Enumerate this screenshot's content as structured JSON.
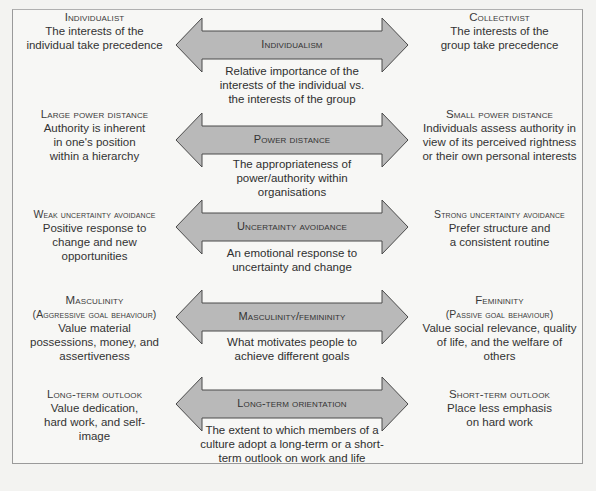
{
  "diagram": {
    "arrow_fill": "#b9b9b9",
    "arrow_stroke": "#4a4a4a",
    "dimensions": [
      {
        "name": "Individualism",
        "left_pole": {
          "title": "Individualist",
          "description": "The interests of the individual take precedence"
        },
        "right_pole": {
          "title": "Collectivist",
          "description": "The interests of the group take precedence"
        },
        "definition": "Relative importance of the interests of the individual vs. the interests of the group"
      },
      {
        "name": "Power distance",
        "left_pole": {
          "title": "Large power distance",
          "description": "Authority is inherent in one's position within a hierarchy"
        },
        "right_pole": {
          "title": "Small power distance",
          "description": "Individuals assess authority in view of its perceived rightness or their own personal interests"
        },
        "definition": "The appropriateness of power/authority within organisations"
      },
      {
        "name": "Uncertainty avoidance",
        "left_pole": {
          "title": "Weak uncertainty avoidance",
          "description": "Positive response to change and new opportunities"
        },
        "right_pole": {
          "title": "Strong uncertainty avoidance",
          "description": "Prefer structure and a consistent routine"
        },
        "definition": "An emotional response to uncertainty and change"
      },
      {
        "name": "Masculinity/femininity",
        "left_pole": {
          "title": "Masculinity",
          "subtitle": "(Aggressive goal behaviour)",
          "description": "Value material possessions, money, and assertiveness"
        },
        "right_pole": {
          "title": "Femininity",
          "subtitle": "(Passive goal behaviour)",
          "description": "Value social relevance, quality of life, and the welfare of others"
        },
        "definition": "What motivates people to achieve different goals"
      },
      {
        "name": "Long-term orientation",
        "left_pole": {
          "title": "Long-term outlook",
          "description": "Value dedication, hard work, and self-image"
        },
        "right_pole": {
          "title": "Short-term outlook",
          "description": "Place less emphasis on hard work"
        },
        "definition": "The extent to which members of a culture adopt a long-term or a short-term outlook on work and life"
      }
    ]
  }
}
